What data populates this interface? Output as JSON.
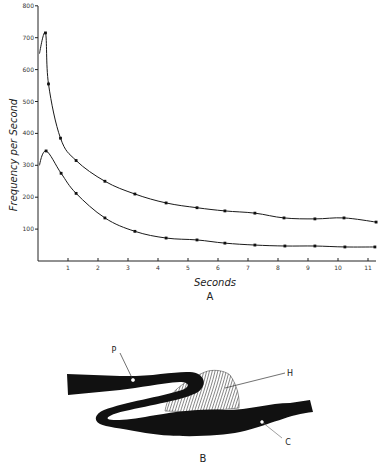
{
  "chart_data": {
    "type": "line",
    "title": "",
    "panel_label": "A",
    "xlabel": "Seconds",
    "ylabel": "Frequency per Second",
    "xlim": [
      0,
      11.5
    ],
    "ylim": [
      0,
      800
    ],
    "xticks": [
      1,
      2,
      3,
      4,
      5,
      6,
      7,
      8,
      9,
      10,
      11
    ],
    "yticks": [
      100,
      200,
      300,
      400,
      500,
      600,
      700,
      800
    ],
    "grid": false,
    "legend": null,
    "series": [
      {
        "name": "upper curve",
        "x": [
          0.05,
          0.25,
          0.35,
          0.75,
          1.27,
          2.23,
          3.23,
          4.27,
          5.3,
          6.23,
          7.23,
          8.2,
          9.23,
          10.2,
          11.27
        ],
        "y": [
          650,
          715,
          555,
          385,
          315,
          250,
          210,
          182,
          167,
          157,
          150,
          135,
          132,
          135,
          122
        ],
        "markers_from_index": 1
      },
      {
        "name": "lower curve",
        "x": [
          0.05,
          0.27,
          0.77,
          1.27,
          2.23,
          3.23,
          4.27,
          5.3,
          6.23,
          7.23,
          8.23,
          9.23,
          10.23,
          11.23
        ],
        "y": [
          300,
          345,
          275,
          212,
          135,
          93,
          72,
          66,
          56,
          50,
          47,
          47,
          44,
          44
        ],
        "markers_from_index": 1
      }
    ]
  },
  "diagram": {
    "panel_label": "B",
    "parts": [
      {
        "key": "P",
        "label": "P"
      },
      {
        "key": "H",
        "label": "H"
      },
      {
        "key": "C",
        "label": "C"
      }
    ]
  }
}
